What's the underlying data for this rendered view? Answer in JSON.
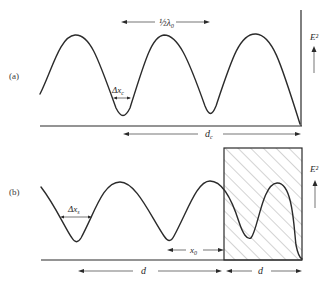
{
  "figure": {
    "panel_a": {
      "label": "(a)",
      "half_wavelength_label": "½λ₀",
      "field_label": "E²",
      "width_label": "Δx",
      "width_sub": "c",
      "distance_label": "d",
      "distance_sub": "c"
    },
    "panel_b": {
      "label": "(b)",
      "field_label": "E²",
      "width_label": "Δx",
      "width_sub": "s",
      "offset_label": "x",
      "offset_sub": "0",
      "distance_left_label": "d",
      "distance_right_label": "d"
    },
    "colors": {
      "line": "#2b2b2b",
      "background": "#ffffff",
      "hatch": "#555555"
    }
  }
}
